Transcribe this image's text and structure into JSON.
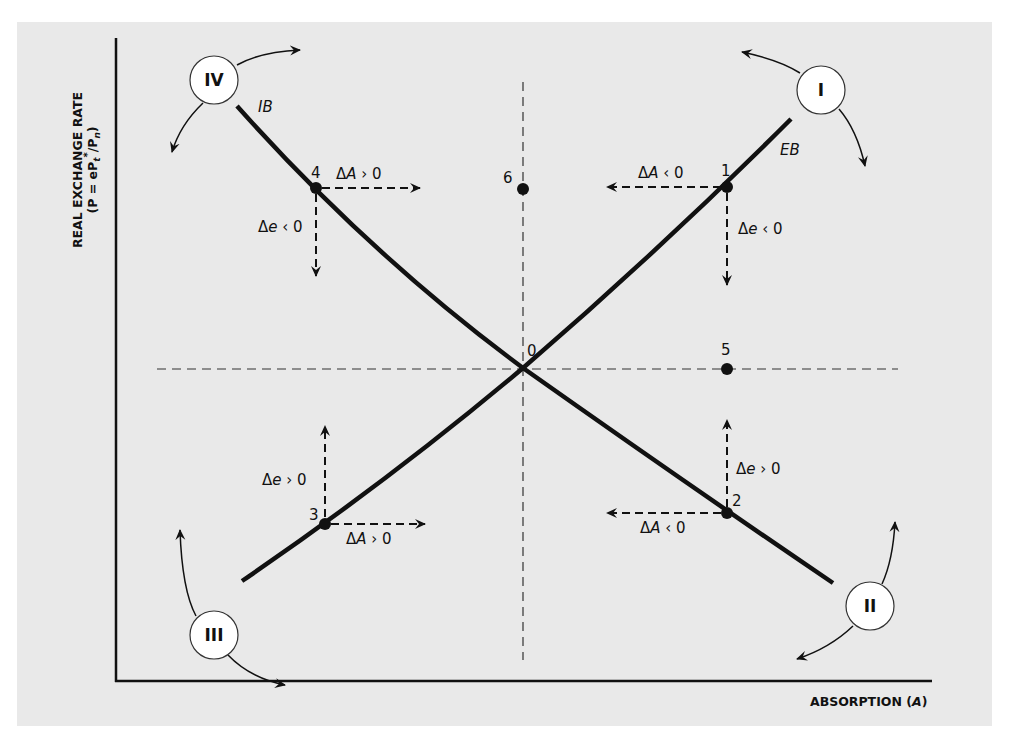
{
  "figure": {
    "type": "phase diagram",
    "y_axis": {
      "title_line1": "REAL EXCHANGE RATE",
      "title_line2_prefix": "(P = eP",
      "title_line2_sub": "t",
      "title_line2_sup": "*",
      "title_line2_mid": "/P",
      "title_line2_sub2": "n",
      "title_line2_suffix": ")"
    },
    "x_axis": {
      "title_prefix": "ABSORPTION (",
      "title_var": "A",
      "title_suffix": ")"
    },
    "curves": [
      {
        "name": "IB",
        "label": "IB",
        "slope": "downward"
      },
      {
        "name": "EB",
        "label": "EB",
        "slope": "upward"
      }
    ],
    "points": [
      {
        "id": "0",
        "label": "0",
        "desc": "intersection of IB and EB"
      },
      {
        "id": "1",
        "label": "1",
        "curve": "EB",
        "arrows": [
          {
            "label_delta": "Δ",
            "label_var": "A",
            "label_rel": " ‹ 0",
            "dir": "left"
          },
          {
            "label_delta": "Δ",
            "label_var": "e",
            "label_rel": " ‹ 0",
            "dir": "down"
          }
        ]
      },
      {
        "id": "2",
        "label": "2",
        "curve": "IB",
        "arrows": [
          {
            "label_delta": "Δ",
            "label_var": "A",
            "label_rel": " ‹ 0",
            "dir": "left"
          },
          {
            "label_delta": "Δ",
            "label_var": "e",
            "label_rel": " › 0",
            "dir": "up"
          }
        ]
      },
      {
        "id": "3",
        "label": "3",
        "curve": "EB",
        "arrows": [
          {
            "label_delta": "Δ",
            "label_var": "A",
            "label_rel": " › 0",
            "dir": "right"
          },
          {
            "label_delta": "Δ",
            "label_var": "e",
            "label_rel": " › 0",
            "dir": "up"
          }
        ]
      },
      {
        "id": "4",
        "label": "4",
        "curve": "IB",
        "arrows": [
          {
            "label_delta": "Δ",
            "label_var": "A",
            "label_rel": " › 0",
            "dir": "right"
          },
          {
            "label_delta": "Δ",
            "label_var": "e",
            "label_rel": " ‹ 0",
            "dir": "down"
          }
        ]
      },
      {
        "id": "5",
        "label": "5",
        "desc": "on horizontal dashed line"
      },
      {
        "id": "6",
        "label": "6",
        "desc": "on vertical dashed line"
      }
    ],
    "regions": [
      {
        "id": "I",
        "label": "I",
        "position": "top-right"
      },
      {
        "id": "II",
        "label": "II",
        "position": "bottom-right"
      },
      {
        "id": "III",
        "label": "III",
        "position": "bottom-left"
      },
      {
        "id": "IV",
        "label": "IV",
        "position": "top-left"
      }
    ],
    "colors": {
      "panel_background": "#e9e9e9",
      "page_background": "#ffffff",
      "ink": "#111111",
      "circle_fill": "#ffffff"
    }
  }
}
